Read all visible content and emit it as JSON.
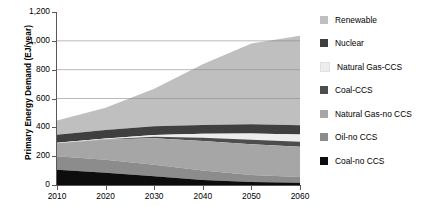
{
  "chart_data": {
    "type": "area",
    "stacked": true,
    "title": "",
    "xlabel": "",
    "ylabel": "Primary Energy Demand (EJ/year)",
    "x": [
      2010,
      2020,
      2030,
      2040,
      2050,
      2060
    ],
    "xlim": [
      2010,
      2060
    ],
    "ylim": [
      0,
      1200
    ],
    "yticks": [
      0,
      200,
      400,
      600,
      800,
      1000,
      1200
    ],
    "ytick_labels": [
      "0",
      "200",
      "400",
      "600",
      "800",
      "1,000",
      "1,200"
    ],
    "xtick_labels": [
      "2010",
      "2020",
      "2030",
      "2040",
      "2050",
      "2060"
    ],
    "grid": "horizontal-at-600-800-1000",
    "legend_position": "right",
    "series": [
      {
        "name": "Renewable",
        "color": "#bfbfbf",
        "values": [
          100,
          155,
          260,
          420,
          560,
          620
        ]
      },
      {
        "name": "Nuclear",
        "color": "#3f3f3f",
        "values": [
          55,
          58,
          60,
          62,
          64,
          65
        ]
      },
      {
        "name": "Natural Gas-CCS",
        "color": "#ededed",
        "values": [
          3,
          5,
          12,
          28,
          44,
          50
        ]
      },
      {
        "name": "Coal-CCS",
        "color": "#4d4d4d",
        "values": [
          0,
          3,
          10,
          22,
          32,
          35
        ]
      },
      {
        "name": "Natural Gas-no CCS",
        "color": "#a6a6a6",
        "values": [
          90,
          140,
          185,
          205,
          212,
          210
        ]
      },
      {
        "name": "Oil-no CCS",
        "color": "#8c8c8c",
        "values": [
          95,
          90,
          80,
          65,
          50,
          40
        ]
      },
      {
        "name": "Coal-no CCS",
        "color": "#0d0d0d",
        "values": [
          105,
          85,
          60,
          35,
          20,
          15
        ]
      }
    ],
    "totals": [
      448,
      536,
      667,
      837,
      982,
      1035
    ]
  },
  "legend": {
    "items": [
      {
        "label": "Renewable"
      },
      {
        "label": "Nuclear"
      },
      {
        "label": "Natural Gas-CCS"
      },
      {
        "label": "Coal-CCS"
      },
      {
        "label": "Natural Gas-no CCS"
      },
      {
        "label": "Oil-no CCS"
      },
      {
        "label": "Coal-no CCS"
      }
    ]
  }
}
